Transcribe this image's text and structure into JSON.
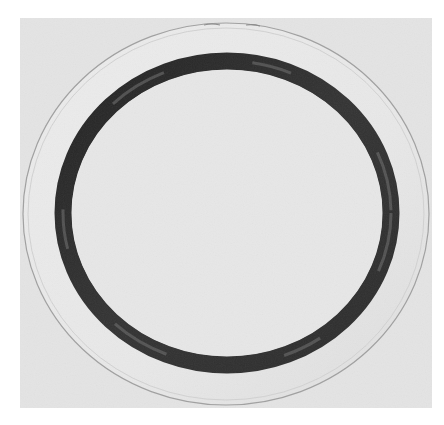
{
  "image": {
    "subject": "circular plate with dark ring",
    "style": "grayscale photograph",
    "colors": {
      "page_background": "#ffffff",
      "photo_background": "#e4e4e4",
      "plate_fill": "#e9e9e9",
      "plate_rim": "#a8a8a8",
      "ring_dark": "#2a2a2a",
      "ring_mid": "#5a5a5a",
      "inner_fill": "#e6e6e6"
    }
  }
}
